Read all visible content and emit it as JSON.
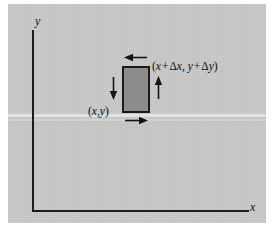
{
  "figure": {
    "type": "physics-control-volume-diagram",
    "background_color": "#c9c9c9",
    "ink_color": "#1a1a1a",
    "rect_fill_color": "#8d8d8d"
  },
  "axes": {
    "y_label": "y",
    "x_label": "x",
    "origin_corner": "bottom-left"
  },
  "control_volume": {
    "fill": "#8d8d8d",
    "stroke": "#1a1a1a"
  },
  "labels": {
    "lower_left_corner": {
      "open_paren": "(",
      "x": "x",
      "comma": ",",
      "y": "y",
      "close_paren": ")"
    },
    "upper_right_corner": {
      "open_paren": "(",
      "x": "x",
      "plus1": "+",
      "delta1": "Δ",
      "dx": "x",
      "comma": ",",
      "y": "y",
      "plus2": "+",
      "delta2": "Δ",
      "dy": "y",
      "close_paren": ")"
    }
  },
  "arrows": [
    {
      "name": "top-face-flux-arrow",
      "direction": "left"
    },
    {
      "name": "right-face-flux-arrow",
      "direction": "up"
    },
    {
      "name": "left-face-flux-arrow",
      "direction": "down"
    },
    {
      "name": "bottom-face-flux-arrow",
      "direction": "right"
    }
  ]
}
